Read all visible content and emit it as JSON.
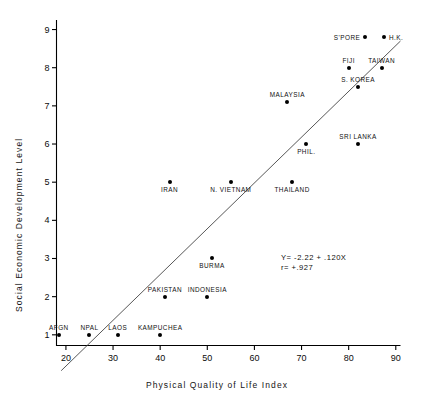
{
  "chart_data": {
    "type": "scatter",
    "title": "",
    "xlabel": "Physical Quality of Life Index",
    "ylabel": "Social Economic Development Level",
    "xlim": [
      18,
      91
    ],
    "ylim": [
      0.72,
      9.25
    ],
    "xticks": [
      20,
      30,
      40,
      50,
      60,
      70,
      80,
      90
    ],
    "xtick_labels": [
      "20",
      "30",
      "40",
      "50",
      "60",
      "70",
      "80",
      "90"
    ],
    "yticks": [
      1,
      2,
      3,
      4,
      5,
      6,
      7,
      8,
      9
    ],
    "ytick_labels": [
      "1",
      "2",
      "3",
      "4",
      "5",
      "6",
      "7",
      "8",
      "9"
    ],
    "grid": false,
    "legend": false,
    "marker_color": "#000000",
    "axis_color": "#000000",
    "line_color": "#444444",
    "points": [
      {
        "label": "AFGN",
        "x": 18.5,
        "y": 1.0,
        "lab_pos": "above"
      },
      {
        "label": "NPAL",
        "x": 25.0,
        "y": 1.0,
        "lab_pos": "above"
      },
      {
        "label": "LAOS",
        "x": 31.0,
        "y": 1.0,
        "lab_pos": "above"
      },
      {
        "label": "KAMPUCHEA",
        "x": 40.0,
        "y": 1.0,
        "lab_pos": "above"
      },
      {
        "label": "PAKISTAN",
        "x": 41.0,
        "y": 2.0,
        "lab_pos": "above"
      },
      {
        "label": "INDONESIA",
        "x": 50.0,
        "y": 2.0,
        "lab_pos": "above"
      },
      {
        "label": "BURMA",
        "x": 51.0,
        "y": 3.0,
        "lab_pos": "below"
      },
      {
        "label": "IRAN",
        "x": 42.0,
        "y": 5.0,
        "lab_pos": "below"
      },
      {
        "label": "N. VIETNAM",
        "x": 55.0,
        "y": 5.0,
        "lab_pos": "below"
      },
      {
        "label": "THAILAND",
        "x": 68.0,
        "y": 5.0,
        "lab_pos": "below"
      },
      {
        "label": "PHIL.",
        "x": 71.0,
        "y": 6.0,
        "lab_pos": "below"
      },
      {
        "label": "SRI LANKA",
        "x": 82.0,
        "y": 6.0,
        "lab_pos": "above"
      },
      {
        "label": "MALAYSIA",
        "x": 67.0,
        "y": 7.1,
        "lab_pos": "above"
      },
      {
        "label": "S. KOREA",
        "x": 82.0,
        "y": 7.5,
        "lab_pos": "above"
      },
      {
        "label": "FIJI",
        "x": 80.0,
        "y": 8.0,
        "lab_pos": "above"
      },
      {
        "label": "TAIWAN",
        "x": 87.0,
        "y": 8.0,
        "lab_pos": "above"
      },
      {
        "label": "S'PORE",
        "x": 83.5,
        "y": 8.8,
        "lab_pos": "left"
      },
      {
        "label": "H.K.",
        "x": 87.5,
        "y": 8.8,
        "lab_pos": "right"
      }
    ],
    "regression": {
      "equation": "Y= -2.22 + .120X",
      "correlation": "r= +.927",
      "slope": 0.12,
      "intercept": -2.22,
      "r": 0.927,
      "x_start": 19.0,
      "x_end": 91.0
    }
  }
}
